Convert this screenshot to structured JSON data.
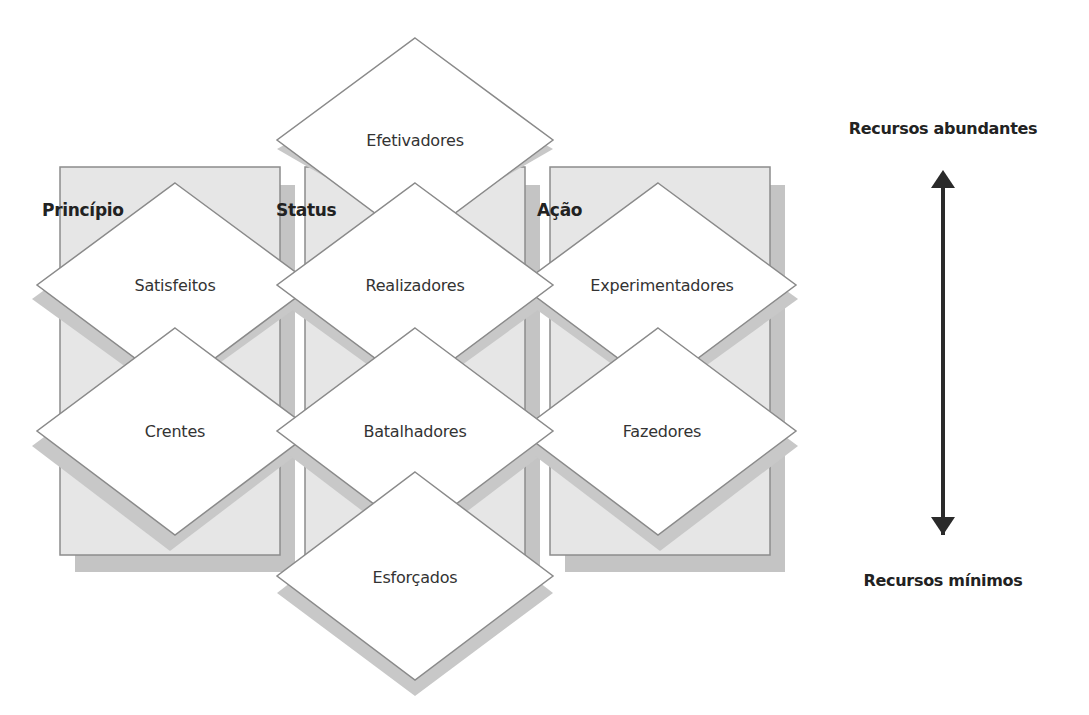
{
  "colors": {
    "panel_fill": "#e6e6e6",
    "panel_shadow": "#c4c4c4",
    "panel_border": "#8c8c8c",
    "diamond_fill": "#ffffff",
    "diamond_border": "#8a8a8a",
    "diamond_shadow": "#c8c8c8",
    "arrow": "#2a2a2a"
  },
  "panels": [
    {
      "label": "Princípio"
    },
    {
      "label": "Status"
    },
    {
      "label": "Ação"
    }
  ],
  "diamonds": {
    "efetivadores": "Efetivadores",
    "satisfeitos": "Satisfeitos",
    "realizadores": "Realizadores",
    "experimentadores": "Experimentadores",
    "crentes": "Crentes",
    "batalhadores": "Batalhadores",
    "fazedores": "Fazedores",
    "esforcados": "Esforçados"
  },
  "axis": {
    "top_label": "Recursos abundantes",
    "bottom_label": "Recursos mínimos",
    "icon": "double-headed-vertical-arrow"
  }
}
